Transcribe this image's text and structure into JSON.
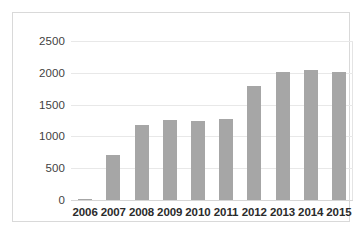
{
  "chart_data": {
    "type": "bar",
    "title": "",
    "subtitle": "",
    "xlabel": "",
    "ylabel": "",
    "categories": [
      "2006",
      "2007",
      "2008",
      "2009",
      "2010",
      "2011",
      "2012",
      "2013",
      "2014",
      "2015"
    ],
    "values": [
      20,
      700,
      1180,
      1260,
      1250,
      1270,
      1790,
      2020,
      2040,
      2020
    ],
    "series": [
      {
        "name": "",
        "values": [
          20,
          700,
          1180,
          1260,
          1250,
          1270,
          1790,
          2020,
          2040,
          2020
        ]
      }
    ],
    "ylim": [
      0,
      2500
    ],
    "y_ticks": [
      0,
      500,
      1000,
      1500,
      2000,
      2500
    ],
    "y_tick_labels": [
      "0",
      "500",
      "1000",
      "1500",
      "2000",
      "2500"
    ],
    "grid": true,
    "grid_axis": "y",
    "legend": false,
    "legend_position": "none",
    "bar_color": "#a6a6a6",
    "gridline_color": "#e8e8e8",
    "axis_label_color": "#3f3f3f",
    "category_label_color": "#2b2b2b",
    "frame_color": "#d9d9d9",
    "background_color": "#ffffff"
  }
}
